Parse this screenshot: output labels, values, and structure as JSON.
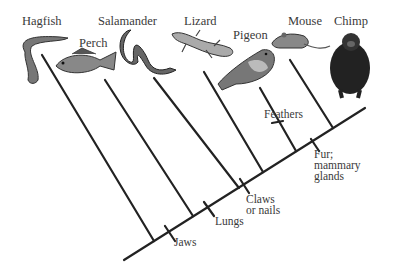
{
  "diagram": {
    "type": "cladogram",
    "taxa": [
      {
        "name": "Hagfish",
        "x": 8,
        "y": 10
      },
      {
        "name": "Perch",
        "x": 79,
        "y": 38
      },
      {
        "name": "Salamander",
        "x": 98,
        "y": 15
      },
      {
        "name": "Lizard",
        "x": 184,
        "y": 15
      },
      {
        "name": "Pigeon",
        "x": 233,
        "y": 29
      },
      {
        "name": "Mouse",
        "x": 288,
        "y": 15
      },
      {
        "name": "Chimp",
        "x": 334,
        "y": 15
      }
    ],
    "traits": [
      {
        "name": "Jaws",
        "x": 174,
        "y": 237
      },
      {
        "name": "Lungs",
        "x": 215,
        "y": 216
      },
      {
        "name": "Claws\nor nails",
        "x": 246,
        "y": 194
      },
      {
        "name": "Feathers",
        "x": 264,
        "y": 108
      },
      {
        "name": "Fur;\nmammary\nglands",
        "x": 314,
        "y": 148
      }
    ],
    "line_color": "#222222",
    "text_color": "#3a3a3a"
  }
}
